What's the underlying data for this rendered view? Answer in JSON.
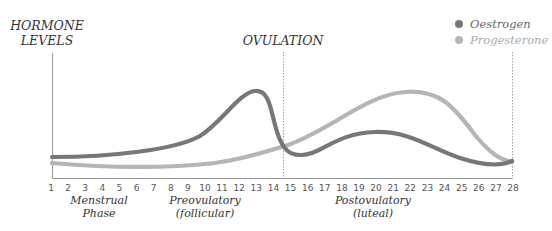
{
  "chart_data": {
    "type": "line",
    "title": "",
    "ylabel": "HORMONE LEVELS",
    "xlabel": "",
    "x": [
      1,
      2,
      3,
      4,
      5,
      6,
      7,
      8,
      9,
      10,
      11,
      12,
      13,
      14,
      15,
      16,
      17,
      18,
      19,
      20,
      21,
      22,
      23,
      24,
      25,
      26,
      27,
      28
    ],
    "x_ticks": [
      "1",
      "2",
      "3",
      "4",
      "5",
      "6",
      "7",
      "8",
      "9",
      "10",
      "11",
      "12",
      "13",
      "14",
      "15",
      "16",
      "17",
      "18",
      "19",
      "20",
      "21",
      "22",
      "23",
      "24",
      "25",
      "26",
      "27",
      "28"
    ],
    "y_range_relative": [
      0,
      100
    ],
    "grid": false,
    "legend_position": "top-right",
    "series": [
      {
        "name": "Oestrogen",
        "color": "#777777",
        "values": [
          24,
          24,
          25,
          26,
          27,
          29,
          31,
          35,
          41,
          52,
          69,
          96,
          78,
          36,
          26,
          26,
          32,
          40,
          44,
          46,
          45,
          42,
          37,
          31,
          24,
          18,
          15,
          18
        ]
      },
      {
        "name": "Progesterone",
        "color": "#b5b5b5",
        "values": [
          17,
          16,
          15,
          14,
          13,
          13,
          13,
          13,
          14,
          15,
          17,
          20,
          23,
          27,
          32,
          41,
          50,
          61,
          70,
          79,
          84,
          86,
          84,
          74,
          56,
          35,
          22,
          19
        ]
      }
    ],
    "annotations": [
      {
        "label": "OVULATION",
        "x": 14.5,
        "style": "dashed vertical line"
      },
      {
        "label": "",
        "x": 28,
        "style": "dashed vertical line"
      }
    ],
    "phases": [
      {
        "label_line1": "Menstrual",
        "label_line2": "Phase",
        "center_day": 3.5
      },
      {
        "label_line1": "Preovulatory",
        "label_line2": "(follicular)",
        "center_day": 10.5
      },
      {
        "label_line1": "Postovulatory",
        "label_line2": "(luteal)",
        "center_day": 20.5
      }
    ]
  },
  "labels": {
    "y_title_line1": "HORMONE",
    "y_title_line2": "LEVELS",
    "ovulation": "OVULATION",
    "legend": [
      {
        "name": "Oestrogen",
        "color": "#777777"
      },
      {
        "name": "Progesterone",
        "color": "#b5b5b5"
      }
    ]
  },
  "colors": {
    "axis": "#9a9a9a",
    "tick_text": "#555555",
    "label_text": "#333333",
    "oestrogen": "#777777",
    "progesterone": "#b5b5b5"
  }
}
